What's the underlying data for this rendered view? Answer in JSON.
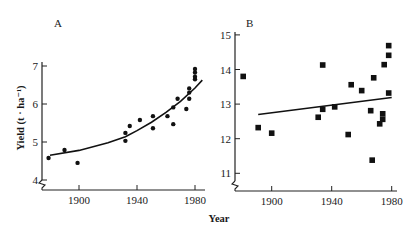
{
  "figure": {
    "xlabel": "Year",
    "ylabel": "Yield (t · ha⁻¹)"
  },
  "chart_data": [
    {
      "panel": "A",
      "type": "scatter",
      "title": "A",
      "xlabel": "Year",
      "ylabel": "Yield (t · ha⁻¹)",
      "xlim": [
        1875,
        1985
      ],
      "ylim": [
        4,
        7
      ],
      "x_ticks": [
        1900,
        1940,
        1980
      ],
      "x_tick_labels": [
        "1900",
        "1940",
        "1980"
      ],
      "y_ticks": [
        4,
        5,
        6,
        7
      ],
      "y_tick_labels": [
        "4",
        "5",
        "6",
        "7"
      ],
      "marker": "circle",
      "grid": false,
      "axis_break": "y",
      "points": [
        [
          1879,
          4.58
        ],
        [
          1890,
          4.79
        ],
        [
          1899,
          4.45
        ],
        [
          1932,
          5.24
        ],
        [
          1932,
          5.03
        ],
        [
          1935,
          5.42
        ],
        [
          1942,
          5.58
        ],
        [
          1951,
          5.68
        ],
        [
          1951,
          5.36
        ],
        [
          1961,
          5.68
        ],
        [
          1965,
          5.91
        ],
        [
          1965,
          5.47
        ],
        [
          1968,
          6.14
        ],
        [
          1974,
          5.87
        ],
        [
          1976,
          6.14
        ],
        [
          1976,
          6.3
        ],
        [
          1976,
          6.41
        ],
        [
          1980,
          6.65
        ],
        [
          1980,
          6.72
        ],
        [
          1980,
          6.83
        ],
        [
          1980,
          6.92
        ]
      ],
      "trend": {
        "type": "quadratic",
        "points": [
          [
            1880,
            4.65
          ],
          [
            1900,
            4.78
          ],
          [
            1920,
            4.98
          ],
          [
            1932,
            5.14
          ],
          [
            1940,
            5.3
          ],
          [
            1950,
            5.52
          ],
          [
            1960,
            5.78
          ],
          [
            1970,
            6.07
          ],
          [
            1980,
            6.42
          ],
          [
            1985,
            6.63
          ]
        ]
      }
    },
    {
      "panel": "B",
      "type": "scatter",
      "title": "B",
      "xlabel": "Year",
      "ylabel": "",
      "xlim": [
        1878,
        1982
      ],
      "ylim": [
        11,
        15
      ],
      "x_ticks": [
        1900,
        1940,
        1980
      ],
      "x_tick_labels": [
        "1900",
        "1940",
        "1980"
      ],
      "y_ticks": [
        11,
        12,
        13,
        14,
        15
      ],
      "y_tick_labels": [
        "11",
        "12",
        "13",
        "14",
        "15"
      ],
      "marker": "square",
      "grid": false,
      "axis_break": "y",
      "points": [
        [
          1881,
          13.8
        ],
        [
          1891,
          12.32
        ],
        [
          1900,
          12.16
        ],
        [
          1931,
          12.62
        ],
        [
          1934,
          14.13
        ],
        [
          1934,
          12.85
        ],
        [
          1942,
          12.92
        ],
        [
          1951,
          12.12
        ],
        [
          1953,
          13.56
        ],
        [
          1960,
          13.39
        ],
        [
          1966,
          12.81
        ],
        [
          1967,
          11.38
        ],
        [
          1968,
          13.76
        ],
        [
          1972,
          12.43
        ],
        [
          1974,
          12.72
        ],
        [
          1974,
          12.56
        ],
        [
          1975,
          14.14
        ],
        [
          1978,
          13.32
        ],
        [
          1978,
          14.41
        ],
        [
          1978,
          14.69
        ]
      ],
      "trend": {
        "type": "linear",
        "points": [
          [
            1891,
            12.7
          ],
          [
            1980,
            13.19
          ]
        ]
      }
    }
  ]
}
